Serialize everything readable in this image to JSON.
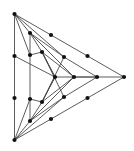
{
  "figure": {
    "title": "",
    "type": "graph-drawing",
    "background_color": "#ffffff",
    "edge_color": "#4a4a4a",
    "node_color": "#111111",
    "node_radius": 2.1,
    "edge_width": 0.9,
    "canvas": {
      "width": 134,
      "height": 151
    }
  },
  "graph": {
    "nodes": [
      {
        "id": "o-top",
        "label": "",
        "x": 14.5,
        "y": 14.0
      },
      {
        "id": "o-l1",
        "label": "",
        "x": 14.5,
        "y": 56.0
      },
      {
        "id": "o-l2",
        "label": "",
        "x": 14.5,
        "y": 98.0
      },
      {
        "id": "o-bot",
        "label": "",
        "x": 14.5,
        "y": 140.0
      },
      {
        "id": "o-tr1",
        "label": "",
        "x": 51.0,
        "y": 35.0
      },
      {
        "id": "o-tr2",
        "label": "",
        "x": 87.5,
        "y": 56.0
      },
      {
        "id": "o-right",
        "label": "",
        "x": 124.0,
        "y": 77.0
      },
      {
        "id": "o-br1",
        "label": "",
        "x": 87.5,
        "y": 98.0
      },
      {
        "id": "o-br2",
        "label": "",
        "x": 51.0,
        "y": 119.0
      },
      {
        "id": "m-top",
        "label": "",
        "x": 30.0,
        "y": 33.0
      },
      {
        "id": "m-l1",
        "label": "",
        "x": 30.0,
        "y": 55.0
      },
      {
        "id": "m-l2",
        "label": "",
        "x": 30.0,
        "y": 99.0
      },
      {
        "id": "m-bot",
        "label": "",
        "x": 30.0,
        "y": 121.0
      },
      {
        "id": "m-tr",
        "label": "",
        "x": 64.0,
        "y": 57.0
      },
      {
        "id": "m-right",
        "label": "",
        "x": 97.0,
        "y": 77.0
      },
      {
        "id": "m-br",
        "label": "",
        "x": 64.0,
        "y": 97.0
      },
      {
        "id": "i-top",
        "label": "",
        "x": 42.0,
        "y": 52.0
      },
      {
        "id": "i-bot",
        "label": "",
        "x": 42.0,
        "y": 102.0
      },
      {
        "id": "i-right",
        "label": "",
        "x": 74.0,
        "y": 77.0
      },
      {
        "id": "c-left",
        "label": "",
        "x": 55.0,
        "y": 77.0
      }
    ],
    "edges": [
      [
        "o-top",
        "o-l1"
      ],
      [
        "o-l1",
        "o-l2"
      ],
      [
        "o-l2",
        "o-bot"
      ],
      [
        "o-top",
        "o-tr1"
      ],
      [
        "o-tr1",
        "o-tr2"
      ],
      [
        "o-tr2",
        "o-right"
      ],
      [
        "o-right",
        "o-br1"
      ],
      [
        "o-br1",
        "o-br2"
      ],
      [
        "o-br2",
        "o-bot"
      ],
      [
        "m-top",
        "m-l1"
      ],
      [
        "m-l1",
        "m-l2"
      ],
      [
        "m-l2",
        "m-bot"
      ],
      [
        "m-top",
        "m-tr"
      ],
      [
        "m-tr",
        "m-right"
      ],
      [
        "m-right",
        "m-br"
      ],
      [
        "m-br",
        "m-bot"
      ],
      [
        "i-top",
        "c-left"
      ],
      [
        "c-left",
        "i-bot"
      ],
      [
        "i-top",
        "i-right"
      ],
      [
        "i-right",
        "i-bot"
      ],
      [
        "o-top",
        "m-top"
      ],
      [
        "o-top",
        "m-l1"
      ],
      [
        "o-bot",
        "m-bot"
      ],
      [
        "o-bot",
        "m-l2"
      ],
      [
        "o-right",
        "m-right"
      ],
      [
        "m-top",
        "i-top"
      ],
      [
        "m-bot",
        "i-bot"
      ],
      [
        "m-right",
        "i-right"
      ],
      [
        "m-top",
        "i-right"
      ],
      [
        "m-bot",
        "i-right"
      ],
      [
        "i-top",
        "m-br"
      ],
      [
        "i-bot",
        "m-tr"
      ],
      [
        "o-l1",
        "c-left"
      ],
      [
        "c-left",
        "i-right"
      ],
      [
        "i-right",
        "m-right"
      ],
      [
        "o-top",
        "m-tr"
      ],
      [
        "o-bot",
        "m-br"
      ],
      [
        "m-l1",
        "i-top"
      ],
      [
        "m-l2",
        "i-bot"
      ],
      [
        "i-top",
        "c-left"
      ],
      [
        "i-bot",
        "c-left"
      ]
    ]
  }
}
